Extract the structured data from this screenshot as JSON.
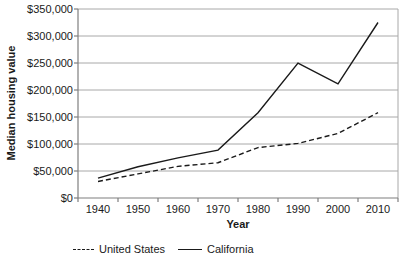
{
  "chart_data": {
    "type": "line",
    "title": "",
    "xlabel": "Year",
    "ylabel": "Median housing value",
    "x": [
      1940,
      1950,
      1960,
      1970,
      1980,
      1990,
      2000,
      2010
    ],
    "series": [
      {
        "name": "United States",
        "style": "dashed",
        "color": "#1a1a1a",
        "values": [
          30600,
          44600,
          58600,
          65300,
          93400,
          101100,
          119600,
          158000
        ]
      },
      {
        "name": "California",
        "style": "solid",
        "color": "#1a1a1a",
        "values": [
          36700,
          57900,
          74400,
          88700,
          158000,
          249800,
          211500,
          325000
        ]
      }
    ],
    "ylim": [
      0,
      350000
    ],
    "ytick_step": 50000,
    "ytick_labels": [
      "$0",
      "$50,000",
      "$100,000",
      "$150,000",
      "$200,000",
      "$250,000",
      "$300,000",
      "$350,000"
    ],
    "grid": "horizontal",
    "legend_position": "bottom"
  },
  "colors": {
    "background": "#ffffff",
    "gridline": "#a8a8a8",
    "axis": "#7f7f7f",
    "text": "#1a1a1a"
  }
}
